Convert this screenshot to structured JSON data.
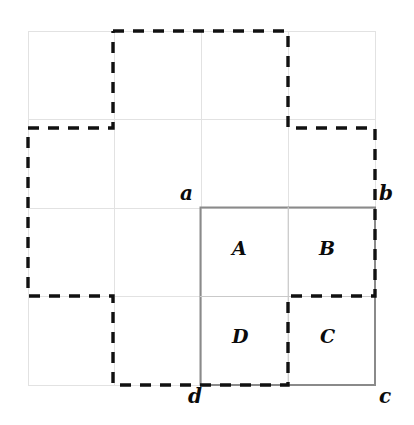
{
  "figure": {
    "background_color": "#ffffff",
    "grid_color": "#e2e2e2",
    "solid_square_color": "#8a8a8a",
    "dashed_path_color": "#111111",
    "grid": {
      "columns": 4,
      "rows": 4,
      "x_min": 28,
      "x_max": 375,
      "y_min": 31,
      "y_max": 385,
      "cell_width": 86.75,
      "cell_height": 88.5
    },
    "solid_square": {
      "name": "abcd",
      "x": 200,
      "y": 207,
      "width": 175,
      "height": 178,
      "subdivisions": 4
    },
    "vertex_labels": [
      {
        "id": "a",
        "text": "a",
        "x": 200,
        "y": 207,
        "placement": "top-left"
      },
      {
        "id": "b",
        "text": "b",
        "x": 375,
        "y": 207,
        "placement": "top-right"
      },
      {
        "id": "c",
        "text": "c",
        "x": 375,
        "y": 385,
        "placement": "bottom-right"
      },
      {
        "id": "d",
        "text": "d",
        "x": 200,
        "y": 385,
        "placement": "bottom-left"
      }
    ],
    "region_labels": [
      {
        "id": "A",
        "text": "A",
        "cell": "top-left"
      },
      {
        "id": "B",
        "text": "B",
        "cell": "top-right"
      },
      {
        "id": "C",
        "text": "C",
        "cell": "bottom-right"
      },
      {
        "id": "D",
        "text": "D",
        "cell": "bottom-left"
      }
    ],
    "dashed_path": {
      "stroke_width": 3.4,
      "dash_pattern": "11 9",
      "points": "113,31 288,31 288,128 375,128 375,296 288,296 288,385 113,385 113,296 28,296 28,128 113,128 113,31"
    },
    "light_grid_lines": {
      "verticals": [
        28,
        114.75,
        201.5,
        288.25,
        375
      ],
      "horizontals": [
        31,
        119.5,
        208,
        296.5,
        385
      ]
    },
    "solid_inner_lines": {
      "vertical": 288,
      "horizontal": 296
    }
  }
}
